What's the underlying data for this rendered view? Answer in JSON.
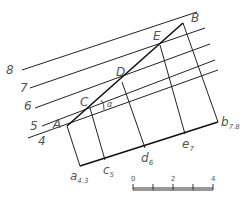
{
  "diagram": {
    "title": "",
    "colors": {
      "line": "#222222",
      "text": "#555555",
      "background": "#ffffff"
    },
    "contour_lines": [
      {
        "label": "4",
        "x1": 28,
        "y1": 138,
        "x2": 218,
        "y2": 70
      },
      {
        "label": "5",
        "x1": 42,
        "y1": 126,
        "x2": 215,
        "y2": 60
      },
      {
        "label": "6",
        "x1": 35,
        "y1": 108,
        "x2": 210,
        "y2": 44
      },
      {
        "label": "7",
        "x1": 30,
        "y1": 88,
        "x2": 205,
        "y2": 28
      },
      {
        "label": "8",
        "x1": 22,
        "y1": 70,
        "x2": 197,
        "y2": 12
      }
    ],
    "contour_labels": [
      {
        "text": "8",
        "x": 6,
        "y": 74
      },
      {
        "text": "7",
        "x": 20,
        "y": 92
      },
      {
        "text": "6",
        "x": 24,
        "y": 110
      },
      {
        "text": "5",
        "x": 30,
        "y": 130
      },
      {
        "text": "4",
        "x": 38,
        "y": 145
      }
    ],
    "points": {
      "A": {
        "label": "A",
        "x": 67,
        "y": 126
      },
      "C": {
        "label": "C",
        "x": 90,
        "y": 108
      },
      "D": {
        "label": "D",
        "x": 122,
        "y": 82
      },
      "E": {
        "label": "E",
        "x": 160,
        "y": 45
      },
      "B": {
        "label": "B",
        "x": 183,
        "y": 23
      }
    },
    "projected_points": {
      "a": {
        "label": "a",
        "sub": "4.3",
        "x": 80,
        "y": 166
      },
      "c": {
        "label": "c",
        "sub": "5",
        "x": 105,
        "y": 160
      },
      "d": {
        "label": "d",
        "sub": "6",
        "x": 145,
        "y": 148
      },
      "e": {
        "label": "e",
        "sub": "7",
        "x": 185,
        "y": 134
      },
      "b": {
        "label": "b",
        "sub": "7.8",
        "x": 218,
        "y": 122
      }
    },
    "angle_label": "α",
    "scale_bar": {
      "ticks": [
        "0",
        "2",
        "4"
      ],
      "x0": 133,
      "x1": 213,
      "y": 188,
      "unit_count": 4
    }
  }
}
